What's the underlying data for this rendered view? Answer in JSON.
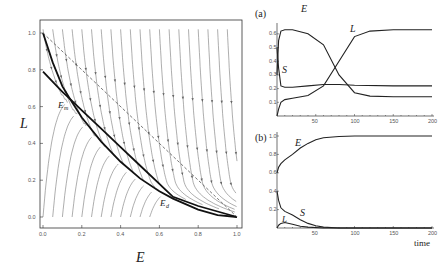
{
  "chart_data": [
    {
      "id": "phase_portrait",
      "type": "line",
      "title": "",
      "xlabel": "E",
      "ylabel": "L",
      "xlim": [
        0,
        1
      ],
      "ylim": [
        0,
        1
      ],
      "xticks": [
        "0.0",
        "0.2",
        "0.4",
        "0.6",
        "0.8",
        "1.0"
      ],
      "yticks": [
        "0.0",
        "0.2",
        "0.4",
        "0.6",
        "0.8",
        "1.0"
      ],
      "background": "stream plot (vector field arrows)",
      "series": [
        {
          "name": "nullcline-1 (convex, from (0,1))",
          "style": "solid-thick",
          "x": [
            0,
            0.05,
            0.1,
            0.14,
            0.2,
            0.3,
            0.4,
            0.5,
            0.6,
            0.67,
            0.8,
            0.9,
            1.0
          ],
          "y": [
            1.0,
            0.84,
            0.71,
            0.64,
            0.54,
            0.41,
            0.3,
            0.21,
            0.14,
            0.1,
            0.04,
            0.01,
            0.0
          ]
        },
        {
          "name": "nullcline-2 (from (0,0.8))",
          "style": "solid-thick",
          "x": [
            0,
            0.1,
            0.14,
            0.2,
            0.3,
            0.4,
            0.5,
            0.6,
            0.67,
            0.8,
            0.9,
            1.0
          ],
          "y": [
            0.79,
            0.68,
            0.64,
            0.58,
            0.48,
            0.38,
            0.28,
            0.18,
            0.11,
            0.06,
            0.03,
            0.0
          ]
        },
        {
          "name": "E + L = 1",
          "style": "dashed",
          "x": [
            0,
            1
          ],
          "y": [
            1,
            0
          ]
        }
      ],
      "annotations": [
        {
          "text": "E",
          "sub": "m",
          "x": 0.14,
          "y": 0.6
        },
        {
          "text": "E",
          "sub": "d",
          "x": 0.6,
          "y": 0.08
        }
      ]
    },
    {
      "id": "panel_a",
      "type": "line",
      "panel_label": "(a)",
      "xlabel": "",
      "ylabel": "",
      "xlim": [
        0,
        200
      ],
      "ylim": [
        0,
        0.65
      ],
      "xticks": [
        "50",
        "100",
        "150",
        "200"
      ],
      "yticks": [
        "0.1",
        "0.2",
        "0.3",
        "0.4",
        "0.5",
        "0.6"
      ],
      "series": [
        {
          "name": "E",
          "x": [
            0,
            2,
            5,
            10,
            20,
            40,
            60,
            80,
            100,
            120,
            150,
            200
          ],
          "y": [
            0.3,
            0.55,
            0.62,
            0.63,
            0.63,
            0.6,
            0.52,
            0.3,
            0.17,
            0.145,
            0.14,
            0.14
          ]
        },
        {
          "name": "L",
          "x": [
            0,
            2,
            5,
            10,
            20,
            40,
            60,
            80,
            100,
            120,
            150,
            200
          ],
          "y": [
            0.0,
            0.05,
            0.1,
            0.12,
            0.13,
            0.15,
            0.22,
            0.4,
            0.58,
            0.62,
            0.63,
            0.63
          ]
        },
        {
          "name": "S",
          "x": [
            0,
            2,
            5,
            10,
            20,
            40,
            60,
            80,
            100,
            150,
            200
          ],
          "y": [
            0.5,
            0.35,
            0.22,
            0.21,
            0.21,
            0.22,
            0.23,
            0.23,
            0.225,
            0.22,
            0.22
          ]
        }
      ],
      "labels": [
        "E",
        "L",
        "S"
      ]
    },
    {
      "id": "panel_b",
      "type": "line",
      "panel_label": "(b)",
      "xlabel": "time",
      "ylabel": "",
      "xlim": [
        0,
        200
      ],
      "ylim": [
        0,
        1.0
      ],
      "xticks": [
        "50",
        "100",
        "150",
        "200"
      ],
      "yticks": [
        "0.2",
        "0.4",
        "0.6",
        "0.8",
        "1.0"
      ],
      "series": [
        {
          "name": "E",
          "x": [
            0,
            2,
            5,
            10,
            20,
            30,
            40,
            50,
            60,
            80,
            100,
            200
          ],
          "y": [
            0.6,
            0.66,
            0.7,
            0.74,
            0.8,
            0.87,
            0.92,
            0.96,
            0.98,
            0.995,
            1.0,
            1.0
          ]
        },
        {
          "name": "S",
          "x": [
            0,
            2,
            5,
            10,
            20,
            30,
            40,
            50,
            60,
            80,
            200
          ],
          "y": [
            0.4,
            0.3,
            0.22,
            0.18,
            0.14,
            0.09,
            0.05,
            0.025,
            0.01,
            0.0,
            0.0
          ]
        },
        {
          "name": "L",
          "x": [
            0,
            2,
            5,
            10,
            20,
            30,
            40,
            60,
            200
          ],
          "y": [
            0.0,
            0.03,
            0.05,
            0.06,
            0.04,
            0.02,
            0.01,
            0.0,
            0.0
          ]
        }
      ],
      "labels": [
        "E",
        "L",
        "S"
      ]
    }
  ],
  "text": {
    "phase_xlabel": "E",
    "phase_ylabel": "L",
    "eq1": "E",
    "eq1_sub": "m",
    "eq2": "E",
    "eq2_sub": "d",
    "panel_a": "(a)",
    "panel_b": "(b)",
    "a_E": "E",
    "a_L": "L",
    "a_S": "S",
    "b_E": "E",
    "b_L": "L",
    "b_S": "S",
    "time_label": "time"
  }
}
